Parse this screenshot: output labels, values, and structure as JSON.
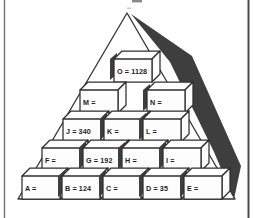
{
  "figure": {
    "colors": {
      "paper": "#ffffff",
      "ink": "#2e2e2e",
      "shadow": "#3e3e3e",
      "frame_left": "#6f6f6f",
      "frame_right": "#4a4a4a"
    },
    "pyramid": {
      "rows": [
        {
          "cubes": [
            {
              "id": "O",
              "label": "O = 1128"
            }
          ]
        },
        {
          "cubes": [
            {
              "id": "M",
              "label": "M ="
            },
            {
              "id": "N",
              "label": "N ="
            }
          ]
        },
        {
          "cubes": [
            {
              "id": "J",
              "label": "J = 340"
            },
            {
              "id": "K",
              "label": "K ="
            },
            {
              "id": "L",
              "label": "L ="
            }
          ]
        },
        {
          "cubes": [
            {
              "id": "F",
              "label": "F ="
            },
            {
              "id": "G",
              "label": "G = 192"
            },
            {
              "id": "H",
              "label": "H ="
            },
            {
              "id": "I",
              "label": "I ="
            }
          ]
        },
        {
          "cubes": [
            {
              "id": "A",
              "label": "A ="
            },
            {
              "id": "B",
              "label": "B = 124"
            },
            {
              "id": "C",
              "label": "C ="
            },
            {
              "id": "D",
              "label": "D = 35"
            },
            {
              "id": "E",
              "label": "E ="
            }
          ]
        }
      ]
    }
  }
}
